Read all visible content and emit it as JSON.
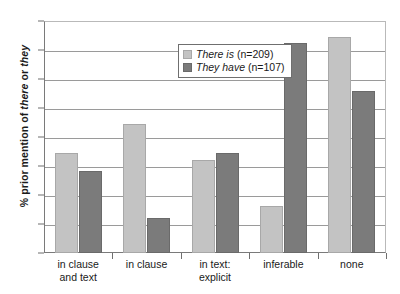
{
  "chart_data": {
    "type": "bar",
    "title": "",
    "xlabel": "",
    "ylabel_parts": {
      "pre": "% prior mention of ",
      "em1": "there",
      "mid": " or ",
      "em2": "they"
    },
    "ylabel": "% prior mention of there or they",
    "categories": [
      "in clause\nand text",
      "in clause",
      "in text:\nexplicit",
      "inferable",
      "none"
    ],
    "series": [
      {
        "name": "There is",
        "n_label": "(n=209)",
        "color": "#c3c3c3",
        "values": [
          17.2,
          22.3,
          16.1,
          8.1,
          37.3
        ]
      },
      {
        "name": "They have",
        "n_label": "(n=107)",
        "color": "#7b7b7b",
        "values": [
          14.2,
          6.1,
          17.2,
          36.2,
          28.0
        ]
      }
    ],
    "ylim": [
      0,
      40
    ],
    "yticks": [
      "0%",
      "5%",
      "10%",
      "15%",
      "20%",
      "25%",
      "30%",
      "35%",
      "40%"
    ],
    "ytick_values": [
      0,
      5,
      10,
      15,
      20,
      25,
      30,
      35,
      40
    ],
    "grid": true,
    "legend_position": "upper-center"
  }
}
